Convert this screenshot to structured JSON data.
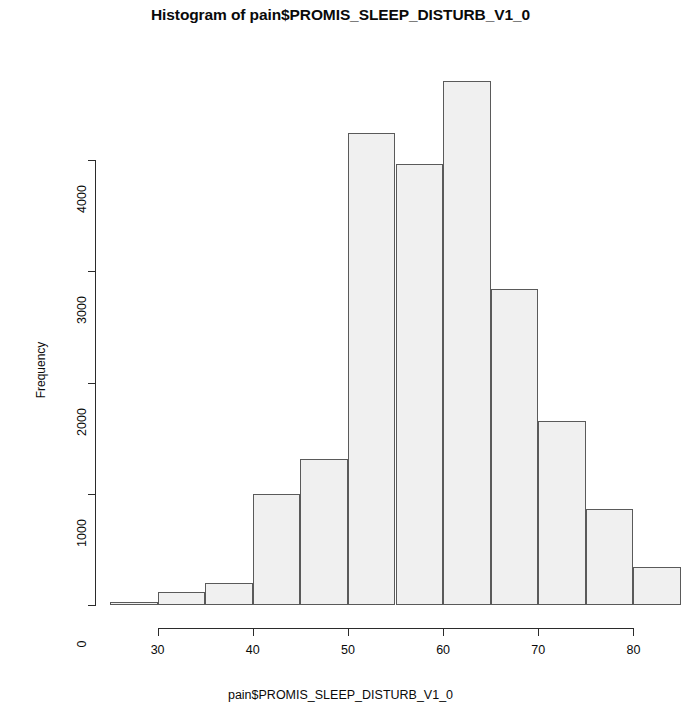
{
  "chart_data": {
    "type": "bar",
    "title": "Histogram of pain$PROMIS_SLEEP_DISTURB_V1_0",
    "xlabel": "pain$PROMIS_SLEEP_DISTURB_V1_0",
    "ylabel": "Frequency",
    "grid": false,
    "legend": "none",
    "xlim": [
      25,
      85
    ],
    "ylim": [
      0,
      4710
    ],
    "bin_width": 5,
    "bin_edges": [
      25,
      30,
      35,
      40,
      45,
      50,
      55,
      60,
      65,
      70,
      75,
      80,
      85
    ],
    "categories": [
      "25-30",
      "30-35",
      "35-40",
      "40-45",
      "45-50",
      "50-55",
      "55-60",
      "60-65",
      "65-70",
      "70-75",
      "75-80",
      "80-85"
    ],
    "values": [
      25,
      115,
      200,
      1000,
      1310,
      4240,
      3960,
      4710,
      2840,
      1650,
      860,
      340
    ],
    "bar_fill": "#f0f0f0",
    "bar_border": "#5a5a5a",
    "axis_color": "#2b2b2b",
    "xticks": [
      {
        "value": 30,
        "label": "30"
      },
      {
        "value": 40,
        "label": "40"
      },
      {
        "value": 50,
        "label": "50"
      },
      {
        "value": 60,
        "label": "60"
      },
      {
        "value": 70,
        "label": "70"
      },
      {
        "value": 80,
        "label": "80"
      }
    ],
    "yticks": [
      {
        "value": 0,
        "label": "0"
      },
      {
        "value": 1000,
        "label": "1000"
      },
      {
        "value": 2000,
        "label": "2000"
      },
      {
        "value": 3000,
        "label": "3000"
      },
      {
        "value": 4000,
        "label": "4000"
      }
    ]
  }
}
